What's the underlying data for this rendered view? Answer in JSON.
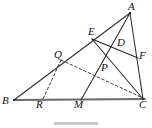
{
  "figure": {
    "caption": "",
    "width": 152,
    "height": 128,
    "stroke_color": "#2a2a2a",
    "base_stroke_color": "#595959",
    "background": "#ffffff"
  },
  "points": {
    "A": {
      "label": "A",
      "x": 130,
      "y": 13,
      "label_x": 128,
      "label_y": 2
    },
    "B": {
      "label": "B",
      "x": 14,
      "y": 100,
      "label_x": 3,
      "label_y": 97
    },
    "C": {
      "label": "C",
      "x": 143,
      "y": 99,
      "label_x": 140,
      "label_y": 101
    },
    "D": {
      "label": "D",
      "x": 117,
      "y": 46,
      "label_x": 118,
      "label_y": 38
    },
    "E": {
      "label": "E",
      "x": 94,
      "y": 38,
      "label_x": 90,
      "label_y": 28
    },
    "F": {
      "label": "F",
      "x": 137,
      "y": 58,
      "label_x": 139,
      "label_y": 52
    },
    "M": {
      "label": "M",
      "x": 81,
      "y": 100,
      "label_x": 75,
      "label_y": 101
    },
    "P": {
      "label": "P",
      "x": 101,
      "y": 71,
      "label_x": 102,
      "label_y": 64
    },
    "Q": {
      "label": "Q",
      "x": 61,
      "y": 60,
      "label_x": 55,
      "label_y": 50
    },
    "R": {
      "label": "R",
      "x": 42,
      "y": 100,
      "label_x": 37,
      "label_y": 101
    }
  },
  "segments": [
    {
      "name": "segment-BC-base",
      "from": "B",
      "to": "C",
      "style": "solid",
      "weight": "thick"
    },
    {
      "name": "segment-BA",
      "from": "B",
      "to": "A",
      "style": "solid",
      "weight": "normal"
    },
    {
      "name": "segment-AC",
      "from": "A",
      "to": "C",
      "style": "solid",
      "weight": "normal"
    },
    {
      "name": "segment-AE",
      "from": "A",
      "to": "E",
      "style": "solid",
      "weight": "normal"
    },
    {
      "name": "segment-AM",
      "from": "A",
      "to": "M",
      "style": "solid",
      "weight": "normal"
    },
    {
      "name": "segment-EF",
      "from": "E",
      "to": "F",
      "style": "solid",
      "weight": "normal"
    },
    {
      "name": "segment-EC",
      "from": "E",
      "to": "C",
      "style": "solid",
      "weight": "normal"
    },
    {
      "name": "segment-QR-dashed",
      "from": "Q",
      "to": "R",
      "style": "dashed",
      "weight": "normal"
    },
    {
      "name": "segment-QC-dashed",
      "from": "Q",
      "to": "C",
      "style": "dashed",
      "weight": "normal"
    }
  ],
  "labels_list": [
    {
      "key": "A",
      "text": "A"
    },
    {
      "key": "B",
      "text": "B"
    },
    {
      "key": "C",
      "text": "C"
    },
    {
      "key": "D",
      "text": "D"
    },
    {
      "key": "E",
      "text": "E"
    },
    {
      "key": "F",
      "text": "F"
    },
    {
      "key": "M",
      "text": "M"
    },
    {
      "key": "P",
      "text": "P"
    },
    {
      "key": "Q",
      "text": "Q"
    },
    {
      "key": "R",
      "text": "R"
    }
  ]
}
